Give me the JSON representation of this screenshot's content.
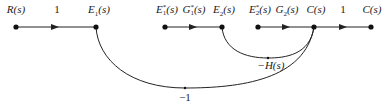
{
  "diagram": {
    "type": "signal-flow-graph",
    "nodes": [
      {
        "id": "R",
        "label": "R(s)",
        "x": 16,
        "y": 27
      },
      {
        "id": "E1",
        "label": "E₁(s)",
        "x": 96,
        "y": 27
      },
      {
        "id": "E1star",
        "label": "E₁*(s)",
        "x": 165,
        "y": 27
      },
      {
        "id": "E2",
        "label": "E₂(s)",
        "x": 222,
        "y": 27
      },
      {
        "id": "E2star",
        "label": "E₂*(s)",
        "x": 258,
        "y": 27
      },
      {
        "id": "C",
        "label": "C(s)",
        "x": 314,
        "y": 27
      },
      {
        "id": "Cout",
        "label": "C(s)",
        "x": 371,
        "y": 27
      }
    ],
    "branches": [
      {
        "from": "R",
        "to": "E1",
        "gain": "1"
      },
      {
        "from": "E1star",
        "to": "E2",
        "gain": "G₁*(s)"
      },
      {
        "from": "E2star",
        "to": "C",
        "gain": "G₂(s)"
      },
      {
        "from": "C",
        "to": "Cout",
        "gain": "1"
      },
      {
        "from": "C",
        "to": "E2",
        "gain": "−H(s)"
      },
      {
        "from": "C",
        "to": "E1",
        "gain": "−1"
      }
    ],
    "labels": {
      "R": "R(s)",
      "gain_R_E1": "1",
      "E1": "E",
      "E1_sub": "1",
      "E1star": "E",
      "E1star_sup": "*",
      "E1star_sub": "1",
      "G1star": "G",
      "G1star_sup": "*",
      "G1star_sub": "1",
      "E2": "E",
      "E2_sub": "2",
      "E2star": "E",
      "E2star_sup": "*",
      "E2star_sub": "2",
      "G2": "G",
      "G2_sub": "2",
      "C": "C(s)",
      "gain_C_out": "1",
      "Cout": "C(s)",
      "H": "−H(s)",
      "neg_one": "−1",
      "s_arg": "(s)"
    }
  }
}
